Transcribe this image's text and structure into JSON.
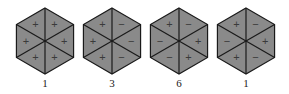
{
  "figure": {
    "fill_color": "#8a8a8a",
    "stroke_color": "#1a1a1a",
    "sign_color": "#3a3a3a",
    "hexagons": [
      {
        "cx": 45,
        "label": "1",
        "signs": [
          "+",
          "+",
          "+",
          "+",
          "+",
          "+"
        ]
      },
      {
        "cx": 112,
        "label": "3",
        "signs": [
          "+",
          "−",
          "−",
          "−",
          "+",
          "+"
        ]
      },
      {
        "cx": 179,
        "label": "6",
        "signs": [
          "+",
          "−",
          "+",
          "+",
          "−",
          "−"
        ]
      },
      {
        "cx": 246,
        "label": "1",
        "signs": [
          "+",
          "−",
          "+",
          "−",
          "+",
          "−"
        ]
      }
    ],
    "sign_order_note": "signs listed clockwise: top-left, top-right, right, bottom-right, bottom-left, left"
  }
}
